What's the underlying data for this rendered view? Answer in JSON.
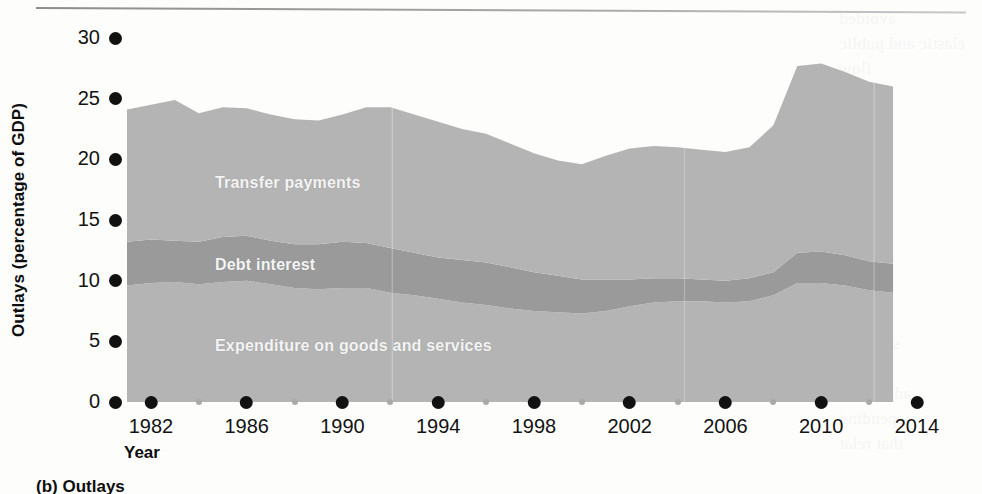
{
  "figure": {
    "caption": "(b) Outlays"
  },
  "chart_data": {
    "type": "area",
    "stacked": true,
    "title": "",
    "xlabel": "Year",
    "ylabel": "Outlays (percentage of GDP)",
    "xlim": [
      1981,
      2014
    ],
    "ylim": [
      0,
      30
    ],
    "grid": false,
    "legend_position": "inline-labels",
    "x_major_ticks": [
      1982,
      1986,
      1990,
      1994,
      1998,
      2002,
      2006,
      2010,
      2014
    ],
    "x_minor_ticks": [
      1984,
      1988,
      1992,
      1996,
      2000,
      2004,
      2008,
      2012
    ],
    "y_ticks": [
      0,
      5,
      10,
      15,
      20,
      25,
      30
    ],
    "colors": {
      "expenditure": "#b4b4b4",
      "debt_interest": "#9a9a9a",
      "transfer_payments": "#b4b4b4",
      "tick": "#111111",
      "minor_tick": "#a9a9a9",
      "label_text": "#f4f4f4"
    },
    "x": [
      1981,
      1982,
      1983,
      1984,
      1985,
      1986,
      1987,
      1988,
      1989,
      1990,
      1991,
      1992,
      1993,
      1994,
      1995,
      1996,
      1997,
      1998,
      1999,
      2000,
      2001,
      2002,
      2003,
      2004,
      2005,
      2006,
      2007,
      2008,
      2009,
      2010,
      2011,
      2012,
      2013
    ],
    "series": [
      {
        "name": "Expenditure on goods and services",
        "label": "Expenditure on goods and services",
        "color": "#b4b4b4",
        "values": [
          9.6,
          9.8,
          9.9,
          9.7,
          9.9,
          10.0,
          9.7,
          9.4,
          9.3,
          9.4,
          9.4,
          9.0,
          8.8,
          8.5,
          8.2,
          8.0,
          7.7,
          7.5,
          7.4,
          7.3,
          7.5,
          7.9,
          8.2,
          8.3,
          8.3,
          8.2,
          8.3,
          8.8,
          9.8,
          9.8,
          9.6,
          9.2,
          9.0
        ]
      },
      {
        "name": "Debt interest",
        "label": "Debt interest",
        "color": "#9a9a9a",
        "values": [
          3.6,
          3.6,
          3.4,
          3.5,
          3.7,
          3.7,
          3.6,
          3.6,
          3.7,
          3.8,
          3.7,
          3.7,
          3.5,
          3.4,
          3.5,
          3.5,
          3.4,
          3.2,
          3.0,
          2.8,
          2.6,
          2.2,
          2.0,
          1.9,
          1.8,
          1.8,
          1.9,
          1.9,
          2.5,
          2.6,
          2.5,
          2.4,
          2.4
        ]
      },
      {
        "name": "Transfer payments",
        "label": "Transfer payments",
        "color": "#b4b4b4",
        "values": [
          10.9,
          11.1,
          11.6,
          10.6,
          10.7,
          10.5,
          10.4,
          10.3,
          10.2,
          10.5,
          11.2,
          11.6,
          11.4,
          11.2,
          10.8,
          10.6,
          10.2,
          9.8,
          9.5,
          9.5,
          10.2,
          10.8,
          10.9,
          10.8,
          10.7,
          10.6,
          10.8,
          12.1,
          15.4,
          15.5,
          15.1,
          14.8,
          14.6
        ]
      }
    ],
    "totals": [
      24.1,
      24.5,
      24.9,
      23.8,
      24.3,
      24.2,
      23.7,
      23.3,
      23.2,
      23.7,
      24.3,
      24.3,
      23.7,
      23.1,
      22.5,
      22.1,
      21.3,
      20.5,
      19.9,
      19.6,
      20.3,
      20.9,
      21.1,
      21.0,
      20.8,
      20.6,
      21.0,
      22.8,
      27.7,
      27.9,
      27.2,
      26.4,
      26.0
    ]
  }
}
